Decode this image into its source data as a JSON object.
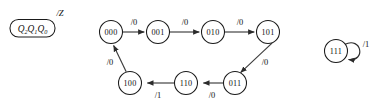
{
  "diagram": {
    "kind": "state-transition-diagram",
    "legend": {
      "state_vars": "Q",
      "sub2": "2",
      "sub1": "1",
      "sub0": "0",
      "output_label": "/Z",
      "box_shape": "rounded-rectangle"
    },
    "states": [
      {
        "id": "s000",
        "label": "000",
        "cx": 111,
        "cy": 32,
        "r": 11.5
      },
      {
        "id": "s001",
        "label": "001",
        "cx": 158,
        "cy": 32,
        "r": 11.5
      },
      {
        "id": "s010",
        "label": "010",
        "cx": 213,
        "cy": 32,
        "r": 11.5
      },
      {
        "id": "s101",
        "label": "101",
        "cx": 268,
        "cy": 32,
        "r": 11.5
      },
      {
        "id": "s011",
        "label": "011",
        "cx": 235,
        "cy": 83,
        "r": 11.5
      },
      {
        "id": "s110",
        "label": "110",
        "cx": 186,
        "cy": 83,
        "r": 11.5
      },
      {
        "id": "s100",
        "label": "100",
        "cx": 130,
        "cy": 83,
        "r": 11.5
      },
      {
        "id": "s111",
        "label": "111",
        "cx": 336,
        "cy": 51,
        "r": 11.5
      }
    ],
    "transitions": [
      {
        "id": "t1",
        "from": "000",
        "to": "001",
        "label": "/0",
        "lx": 134,
        "ly": 22
      },
      {
        "id": "t2",
        "from": "001",
        "to": "010",
        "label": "/0",
        "lx": 185,
        "ly": 22
      },
      {
        "id": "t3",
        "from": "010",
        "to": "101",
        "label": "/0",
        "lx": 240,
        "ly": 22
      },
      {
        "id": "t4",
        "from": "101",
        "to": "011",
        "label": "/0",
        "lx": 264,
        "ly": 62
      },
      {
        "id": "t5",
        "from": "011",
        "to": "110",
        "label": "/0",
        "lx": 212,
        "ly": 95
      },
      {
        "id": "t6",
        "from": "110",
        "to": "100",
        "label": "/1",
        "lx": 158,
        "ly": 95
      },
      {
        "id": "t7",
        "from": "100",
        "to": "000",
        "label": "/0",
        "lx": 112,
        "ly": 62
      },
      {
        "id": "t8",
        "from": "111",
        "to": "111",
        "label": "/1",
        "lx": 365,
        "ly": 44
      }
    ],
    "colors": {
      "stroke": "#1a1a1a",
      "edge": "#3b3b3b",
      "background": "#ffffff",
      "text": "#111111"
    }
  }
}
